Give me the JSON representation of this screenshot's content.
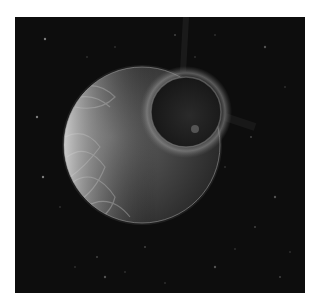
{
  "artwork": {
    "subject": "Gray-scale space painting: banded planet with a dark moon in front, on a starfield",
    "background_color": "#ffffff",
    "frame_color": "#0d0d0d",
    "planet": {
      "cx": 127,
      "cy": 128,
      "r": 78,
      "light_color": "#c8c8c8",
      "dark_color": "#3a3a3a"
    },
    "moon": {
      "cx": 171,
      "cy": 95,
      "r": 35,
      "color": "#1a1a1a",
      "glow_color": "#8a8a8a"
    },
    "stars": [
      [
        30,
        22
      ],
      [
        72,
        40
      ],
      [
        100,
        30
      ],
      [
        160,
        18
      ],
      [
        250,
        30
      ],
      [
        270,
        70
      ],
      [
        236,
        120
      ],
      [
        210,
        150
      ],
      [
        260,
        180
      ],
      [
        240,
        210
      ],
      [
        275,
        235
      ],
      [
        220,
        232
      ],
      [
        28,
        160
      ],
      [
        45,
        190
      ],
      [
        60,
        250
      ],
      [
        82,
        240
      ],
      [
        90,
        260
      ],
      [
        110,
        255
      ],
      [
        130,
        230
      ],
      [
        150,
        266
      ],
      [
        200,
        250
      ],
      [
        265,
        260
      ],
      [
        180,
        40
      ],
      [
        200,
        18
      ],
      [
        22,
        100
      ]
    ]
  }
}
